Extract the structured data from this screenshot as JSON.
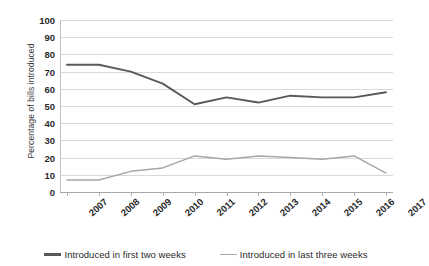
{
  "chart_data": {
    "type": "line",
    "title": "",
    "xlabel": "",
    "ylabel": "Percentage of bills introduced",
    "ylim": [
      0,
      100
    ],
    "ytick_step": 10,
    "yticks": [
      100,
      90,
      80,
      70,
      60,
      50,
      40,
      30,
      20,
      10,
      0
    ],
    "grid": "horizontal",
    "legend_position": "bottom",
    "categories": [
      "2007",
      "2008",
      "2009",
      "2010",
      "2011",
      "2012",
      "2013",
      "2014",
      "2015",
      "2016",
      "2017"
    ],
    "series": [
      {
        "name": "Introduced in first two weeks",
        "color": "#595959",
        "values": [
          74,
          74,
          70,
          63,
          51,
          55,
          52,
          56,
          55,
          55,
          58
        ]
      },
      {
        "name": "Introduced in last three weeks",
        "color": "#a6a6a6",
        "values": [
          7,
          7,
          12,
          14,
          21,
          19,
          21,
          20,
          19,
          21,
          11
        ]
      }
    ]
  },
  "legend": {
    "items": [
      {
        "label": "Introduced in first two weeks",
        "color": "#595959"
      },
      {
        "label": "Introduced in last three weeks",
        "color": "#a6a6a6"
      }
    ]
  }
}
